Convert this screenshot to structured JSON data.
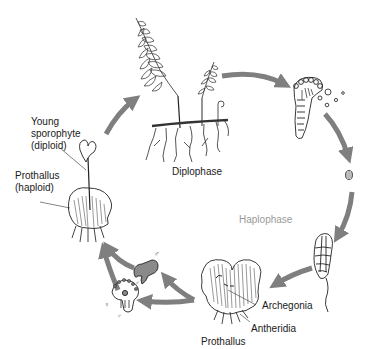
{
  "diagram": {
    "phases": {
      "diplophase": "Diplophase",
      "haplophase": "Haplophase"
    },
    "labels": {
      "young_sporophyte": [
        "Young",
        "sporophyte",
        "(diploid)"
      ],
      "prothallus_haploid": [
        "Prothallus",
        "(haploid)"
      ],
      "archegonia": "Archegonia",
      "antheridia": "Antheridia",
      "prothallus": "Prothallus"
    },
    "stages": [
      {
        "id": "mature-sporophyte",
        "name": "Mature fern sporophyte"
      },
      {
        "id": "sporangium",
        "name": "Sporangium releasing spores"
      },
      {
        "id": "spore",
        "name": "Spore"
      },
      {
        "id": "germinating-spore",
        "name": "Germinating spore"
      },
      {
        "id": "prothallus",
        "name": "Prothallus"
      },
      {
        "id": "antheridium",
        "name": "Antheridium (male)"
      },
      {
        "id": "archegonium",
        "name": "Archegonium (female)"
      },
      {
        "id": "young-sporophyte",
        "name": "Young sporophyte on prothallus"
      }
    ],
    "symbols": {
      "male": "♂",
      "female": "♀"
    },
    "colors": {
      "arrow": "#7f7f7f",
      "ink": "#1a1a1a",
      "haplophase_text": "#9a9a9a",
      "background": "#ffffff"
    }
  }
}
